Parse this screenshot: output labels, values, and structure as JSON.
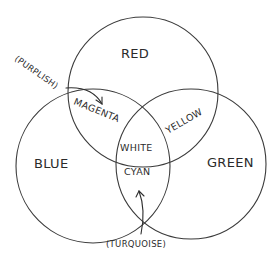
{
  "diagram": {
    "type": "venn-diagram",
    "style": "hand-drawn",
    "circles": [
      {
        "id": "red",
        "label": "RED"
      },
      {
        "id": "blue",
        "label": "BLUE"
      },
      {
        "id": "green",
        "label": "GREEN"
      }
    ],
    "intersections": {
      "red_blue": "MAGENTA",
      "red_green": "YELLOW",
      "blue_green": "CYAN",
      "all": "WHITE"
    },
    "annotations": [
      {
        "text": "(PURPLISH)",
        "points_to": "MAGENTA"
      },
      {
        "text": "(TURQUOISE)",
        "points_to": "CYAN"
      }
    ],
    "colors": {
      "stroke": "#3a3a3a",
      "text": "#2b2b2b",
      "background": "#ffffff"
    }
  }
}
